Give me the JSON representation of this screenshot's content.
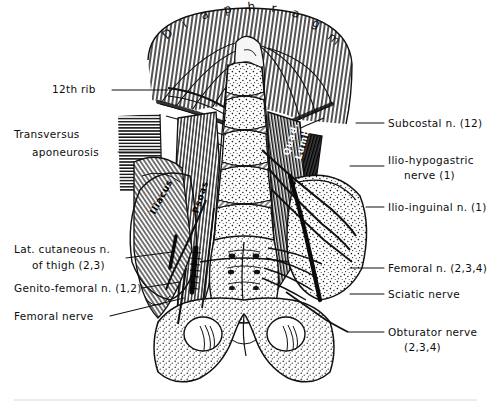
{
  "figure": {
    "title_letters": [
      "D",
      "i",
      "a",
      "p",
      "h",
      "r",
      "a",
      "g",
      "m"
    ],
    "background_color": "#ffffff",
    "ink_color": "#111111",
    "medium": "line-engraving anatomical illustration"
  },
  "labels_left": [
    {
      "id": "rib12",
      "text": "12th rib",
      "line2": "",
      "x": 52,
      "y": 93,
      "leader": [
        [
          112,
          90
        ],
        [
          168,
          90
        ]
      ]
    },
    {
      "id": "transversus",
      "text": "Transversus",
      "line2": "aponeurosis",
      "x": 14,
      "y": 138,
      "leader": [
        [
          118,
          152
        ],
        [
          160,
          152
        ]
      ]
    },
    {
      "id": "lat-cut",
      "text": "Lat. cutaneous n.",
      "line2": "of thigh (2,3)",
      "x": 14,
      "y": 253,
      "leader": [
        [
          126,
          265
        ],
        [
          172,
          258
        ]
      ]
    },
    {
      "id": "genitofemoral",
      "text": "Genito-femoral n. (1,2)",
      "line2": "",
      "x": 14,
      "y": 292,
      "leader": [
        [
          142,
          288
        ],
        [
          176,
          283
        ]
      ]
    },
    {
      "id": "femoral-nerve",
      "text": "Femoral nerve",
      "line2": "",
      "x": 14,
      "y": 320,
      "leader": [
        [
          110,
          316
        ],
        [
          178,
          300
        ]
      ]
    }
  ],
  "labels_right": [
    {
      "id": "subcostal",
      "text": "Subcostal n. (12)",
      "line2": "",
      "x": 388,
      "y": 127,
      "leader": [
        [
          356,
          123
        ],
        [
          384,
          123
        ]
      ]
    },
    {
      "id": "iliohypo",
      "text": "Ilio-hypogastric",
      "line2": "nerve (1)",
      "x": 388,
      "y": 164,
      "leader": [
        [
          350,
          166
        ],
        [
          384,
          166
        ]
      ]
    },
    {
      "id": "ilioinguinal",
      "text": "Ilio-inguinal n. (1)",
      "line2": "",
      "x": 388,
      "y": 211,
      "leader": [
        [
          366,
          207
        ],
        [
          384,
          207
        ]
      ]
    },
    {
      "id": "femoral-n",
      "text": "Femoral n. (2,3,4)",
      "line2": "",
      "x": 388,
      "y": 272,
      "leader": [
        [
          350,
          268
        ],
        [
          384,
          268
        ]
      ]
    },
    {
      "id": "sciatic",
      "text": "Sciatic nerve",
      "line2": "",
      "x": 388,
      "y": 298,
      "leader": [
        [
          350,
          294
        ],
        [
          384,
          294
        ]
      ]
    },
    {
      "id": "obturator",
      "text": "Obturator nerve",
      "line2": "(2,3,4)",
      "x": 388,
      "y": 336,
      "leader": [
        [
          348,
          332
        ],
        [
          384,
          332
        ]
      ]
    }
  ],
  "labels_on_image": [
    {
      "id": "iliacus",
      "text": "Iliacus",
      "x": 155,
      "y": 215,
      "rotate": -62
    },
    {
      "id": "psoas",
      "text": "Psoas",
      "x": 198,
      "y": 214,
      "rotate": -72
    },
    {
      "id": "quad-lumb1",
      "text": "Quad.",
      "x": 291,
      "y": 152,
      "rotate": -74
    },
    {
      "id": "quad-lumb2",
      "text": "Lumb.",
      "x": 303,
      "y": 155,
      "rotate": -74
    }
  ],
  "structures": [
    "diaphragm dome with radial muscle fibre hatching",
    "12th rib",
    "transversus abdominis aponeurosis (horizontal hatching)",
    "quadratus lumborum (dark cross-hatched panel)",
    "psoas major (vertical fibre hatching)",
    "iliacus (fan fibre hatching)",
    "lumbar vertebral bodies with stippled bone and hatched discs",
    "sacrum with anterior sacral foramina",
    "iliac crest and ala (stippled bone)",
    "pubic rami and obturator foramina",
    "lumbar plexus nerve roots and branches"
  ]
}
